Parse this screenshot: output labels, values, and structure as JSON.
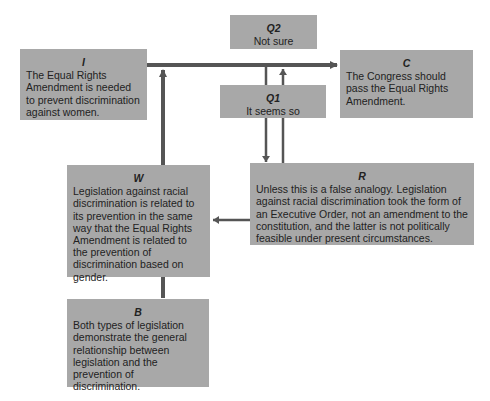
{
  "diagram": {
    "type": "Toulmin argument model",
    "nodes": {
      "I": {
        "label": "I",
        "text": "The Equal Rights Amendment is needed to prevent discrimination against women."
      },
      "Q2": {
        "label": "Q2",
        "text": "Not sure"
      },
      "C": {
        "label": "C",
        "text": "The Congress should pass the Equal Rights Amendment."
      },
      "Q1": {
        "label": "Q1",
        "text": "It seems so"
      },
      "W": {
        "label": "W",
        "text": "Legislation against racial discrimination is related to its prevention in the same way that the Equal Rights Amendment is related to the prevention of discrimination based on gender."
      },
      "R": {
        "label": "R",
        "text": "Unless this is a false analogy. Legislation against racial discrimination took the form of an Executive Order, not an amendment to the constitution, and the latter is not politically feasible under present circumstances."
      },
      "B": {
        "label": "B",
        "text": "Both types of legislation demonstrate the general relationship between legislation and the prevention of discrimination."
      }
    },
    "edges": [
      {
        "from": "I",
        "to": "C"
      },
      {
        "from": "W",
        "to": "I"
      },
      {
        "from": "B",
        "to": "W"
      },
      {
        "from": "Q1",
        "to": "R"
      },
      {
        "from": "R",
        "to": "Q1"
      },
      {
        "from": "R",
        "to": "W"
      }
    ],
    "colors": {
      "box": "#a8a8a8",
      "line": "#555555",
      "background": "#ffffff"
    }
  }
}
